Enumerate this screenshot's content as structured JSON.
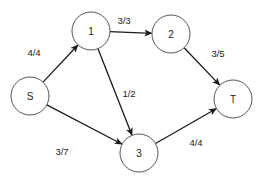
{
  "diagram": {
    "type": "flow-network",
    "nodes": [
      {
        "id": "S",
        "label": "S",
        "cx": 30,
        "cy": 96,
        "r": 19
      },
      {
        "id": "1",
        "label": "1",
        "cx": 91,
        "cy": 31,
        "r": 19
      },
      {
        "id": "2",
        "label": "2",
        "cx": 171,
        "cy": 34,
        "r": 19
      },
      {
        "id": "3",
        "label": "3",
        "cx": 139,
        "cy": 153,
        "r": 19
      },
      {
        "id": "T",
        "label": "T",
        "cx": 233,
        "cy": 99,
        "r": 19
      }
    ],
    "edges": [
      {
        "from": "S",
        "to": "1",
        "flow": 4,
        "capacity": 4,
        "label": "4/4",
        "lx": 34,
        "ly": 52
      },
      {
        "from": "1",
        "to": "2",
        "flow": 3,
        "capacity": 3,
        "label": "3/3",
        "lx": 124,
        "ly": 20
      },
      {
        "from": "2",
        "to": "T",
        "flow": 3,
        "capacity": 5,
        "label": "3/5",
        "lx": 218,
        "ly": 53
      },
      {
        "from": "1",
        "to": "3",
        "flow": 1,
        "capacity": 2,
        "label": "1/2",
        "lx": 129,
        "ly": 93
      },
      {
        "from": "S",
        "to": "3",
        "flow": 3,
        "capacity": 7,
        "label": "3/7",
        "lx": 62,
        "ly": 151
      },
      {
        "from": "3",
        "to": "T",
        "flow": 4,
        "capacity": 4,
        "label": "4/4",
        "lx": 196,
        "ly": 142
      }
    ],
    "colors": {
      "node_stroke": "#555555",
      "edge": "#1a1a1a",
      "text": "#222222",
      "background": "#ffffff"
    }
  }
}
